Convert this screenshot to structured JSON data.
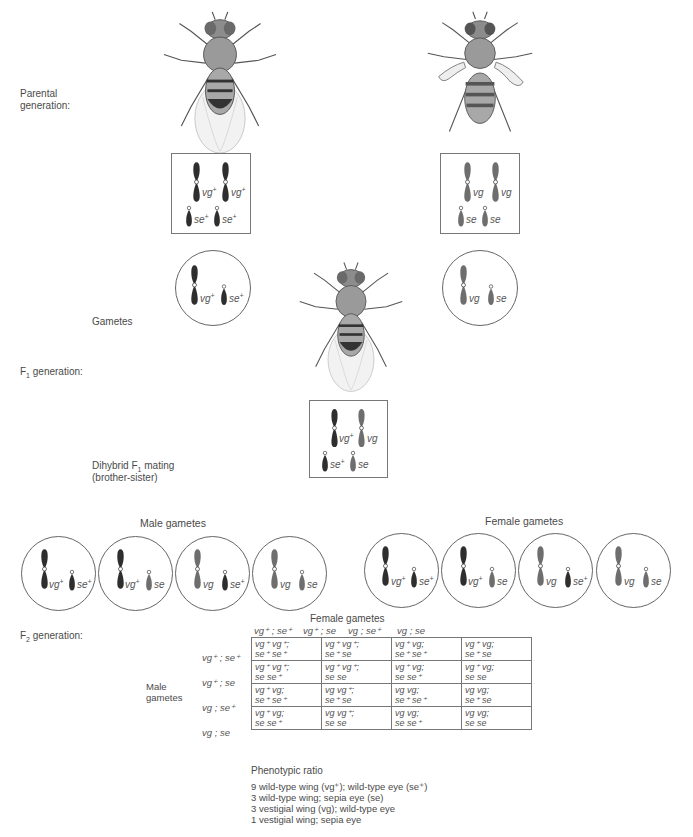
{
  "labels": {
    "parental": [
      "Parental",
      "generation:"
    ],
    "gametes": "Gametes",
    "f1": {
      "prefix": "F",
      "sub": "1",
      "suffix": " generation:"
    },
    "dihybrid": {
      "line1_prefix": "Dihybrid F",
      "line1_sub": "1",
      "line1_suffix": " mating",
      "line2": "(brother-sister)"
    },
    "male_gametes": "Male gametes",
    "female_gametes": "Female gametes",
    "f2": {
      "prefix": "F",
      "sub": "2",
      "suffix": " generation:"
    }
  },
  "parental": {
    "wild_type_fly": {
      "description": "wild-type fly",
      "genotype": [
        "vg+",
        "vg+",
        "se+",
        "se+"
      ]
    },
    "mutant_fly": {
      "description": "vestigial-wing sepia-eye fly",
      "genotype": [
        "vg",
        "vg",
        "se",
        "se"
      ]
    }
  },
  "parental_gametes": [
    {
      "vg": "vg",
      "vg_sup": "+",
      "se": "se",
      "se_sup": "+"
    },
    {
      "vg": "vg",
      "vg_sup": "",
      "se": "se",
      "se_sup": ""
    }
  ],
  "f1": {
    "genotype": [
      "vg+",
      "vg",
      "se+",
      "se"
    ]
  },
  "male_gametes": [
    {
      "vg": "vg",
      "vg_sup": "+",
      "se": "se",
      "se_sup": "+"
    },
    {
      "vg": "vg",
      "vg_sup": "+",
      "se": "se",
      "se_sup": ""
    },
    {
      "vg": "vg",
      "vg_sup": "",
      "se": "se",
      "se_sup": "+"
    },
    {
      "vg": "vg",
      "vg_sup": "",
      "se": "se",
      "se_sup": ""
    }
  ],
  "female_gametes": [
    {
      "vg": "vg",
      "vg_sup": "+",
      "se": "se",
      "se_sup": "+"
    },
    {
      "vg": "vg",
      "vg_sup": "+",
      "se": "se",
      "se_sup": ""
    },
    {
      "vg": "vg",
      "vg_sup": "",
      "se": "se",
      "se_sup": "+"
    },
    {
      "vg": "vg",
      "vg_sup": "",
      "se": "se",
      "se_sup": ""
    }
  ],
  "punnett": {
    "title": "Female gametes",
    "row_title": [
      "Male",
      "gametes"
    ],
    "columns": [
      "vg⁺ ; se⁺",
      "vg⁺ ; se",
      "vg ; se⁺",
      "vg ; se"
    ],
    "rows": [
      "vg⁺ ; se⁺",
      "vg⁺ ; se",
      "vg ; se⁺",
      "vg ; se"
    ],
    "cells": [
      [
        [
          "vg⁺ vg⁺;",
          "se⁺ se⁺"
        ],
        [
          "vg⁺ vg⁺;",
          "se⁺ se"
        ],
        [
          "vg⁺ vg;",
          "se⁺ se⁺"
        ],
        [
          "vg⁺ vg;",
          "se⁺ se"
        ]
      ],
      [
        [
          "vg⁺ vg⁺;",
          "se se⁺"
        ],
        [
          "vg⁺ vg⁺;",
          "se se"
        ],
        [
          "vg⁺ vg;",
          "se se⁺"
        ],
        [
          "vg⁺ vg;",
          "se se"
        ]
      ],
      [
        [
          "vg⁺ vg;",
          "se⁺ se⁺"
        ],
        [
          "vg vg⁺;",
          "se⁺ se"
        ],
        [
          "vg vg;",
          "se⁺ se⁺"
        ],
        [
          "vg vg;",
          "se⁺ se"
        ]
      ],
      [
        [
          "vg⁺ vg;",
          "se se⁺"
        ],
        [
          "vg vg⁺;",
          "se se"
        ],
        [
          "vg vg;",
          "se se⁺"
        ],
        [
          "vg vg;",
          "se se"
        ]
      ]
    ]
  },
  "phenotypic_ratio": {
    "title": "Phenotypic ratio",
    "lines": [
      "9 wild-type wing (vg⁺); wild-type eye (se⁺)",
      "3 wild-type wing; sepia eye (se)",
      "3 vestigial wing (vg); wild-type eye",
      "1 vestigial wing; sepia eye"
    ]
  },
  "colors": {
    "dark_chromosome": "#2e2e2e",
    "light_chromosome": "#6e6e6e",
    "outline": "#777777",
    "text": "#4a4a4a"
  }
}
